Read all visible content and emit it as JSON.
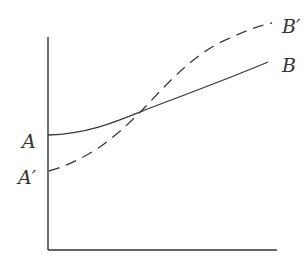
{
  "diagram": {
    "type": "line-comparison",
    "axes": {
      "x_label": "",
      "y_label": ""
    },
    "curves": [
      {
        "name": "solid-curve",
        "style": "solid",
        "start_label": "A",
        "end_label": "B",
        "description": "Starts higher at A, rises gently to B"
      },
      {
        "name": "dashed-curve",
        "style": "dashed",
        "start_label": "A′",
        "end_label": "B′",
        "description": "Starts lower at A', rises steeply, crosses solid curve, ends higher at B'"
      }
    ],
    "labels": {
      "A": "A",
      "A_prime": "A′",
      "B": "B",
      "B_prime": "B′"
    },
    "colors": {
      "line": "#3a3a3a",
      "text": "#333333",
      "background": "#ffffff"
    }
  }
}
